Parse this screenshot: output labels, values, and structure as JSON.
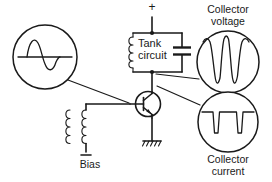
{
  "diagram": {
    "background_color": "#ffffff",
    "line_color": "#1a1a1a",
    "labels": {
      "tank_line1": "Tank",
      "tank_line2": "circuit",
      "bias": "Bias",
      "collector_voltage_line1": "Collector",
      "collector_voltage_line2": "voltage",
      "collector_current_line1": "Collector",
      "collector_current_line2": "current",
      "supply_polarity": "+"
    },
    "components": {
      "transistor": {
        "type": "npn-bipolar-transistor"
      },
      "tank_inductor": {
        "type": "inductor"
      },
      "tank_capacitor": {
        "type": "capacitor"
      },
      "feedback_transformer": {
        "type": "transformer"
      },
      "ground": {
        "type": "chassis-ground"
      },
      "bias_terminal": {
        "type": "battery-terminal"
      }
    },
    "scopes": [
      {
        "name": "input-sine-scope",
        "waveform": "sine",
        "description": "sine wave with horizontal baseline",
        "probe_point": "transistor base"
      },
      {
        "name": "collector-voltage-scope",
        "waveform": "narrow-negative-dips",
        "description": "near-sinusoidal crests with sharp narrow dips",
        "probe_point": "collector"
      },
      {
        "name": "collector-current-scope",
        "waveform": "narrow-downward-pulses",
        "description": "flat top with narrow downward current pulses",
        "probe_point": "collector"
      }
    ]
  }
}
